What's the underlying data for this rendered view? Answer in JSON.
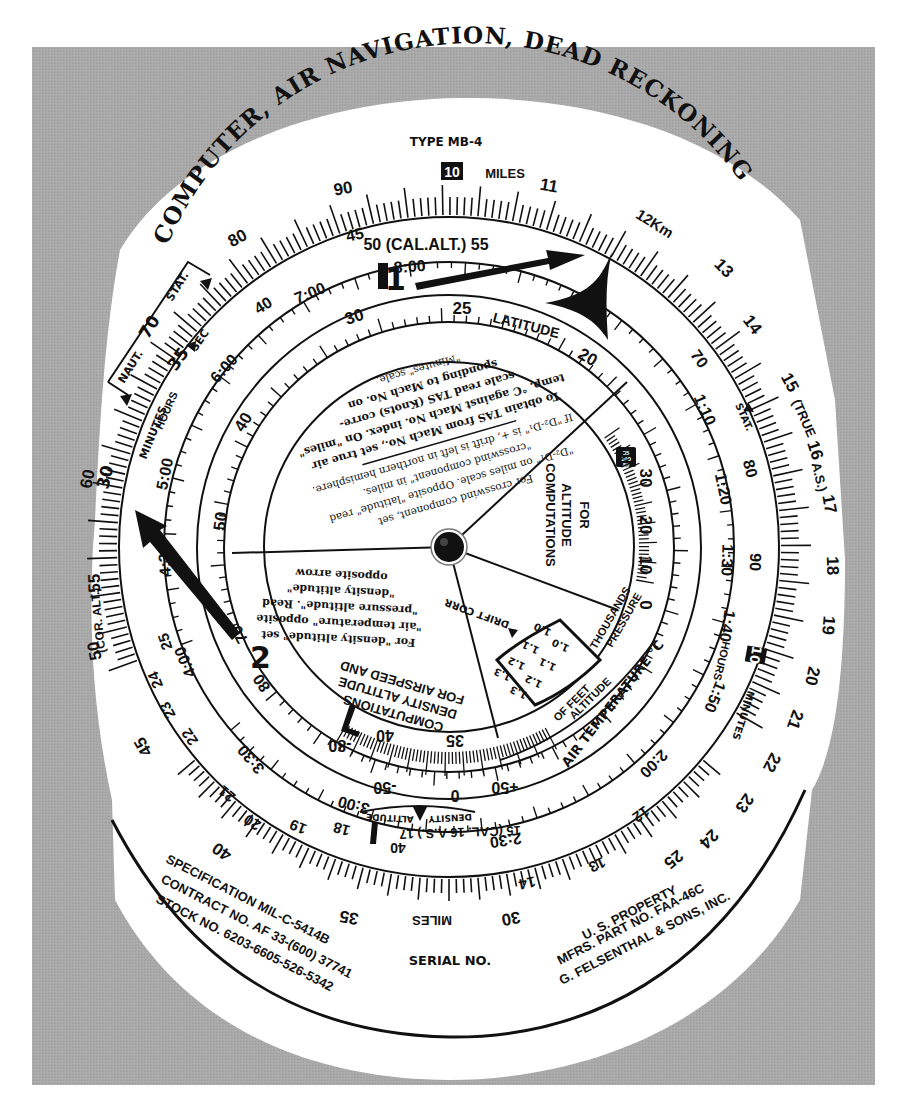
{
  "colors": {
    "mat_gray": "#a7a7a7",
    "card_white": "#ffffff",
    "ink": "#111111"
  },
  "header": {
    "title": "COMPUTER, AIR NAVIGATION, DEAD RECKONING",
    "subtitle": "TYPE MB-4"
  },
  "outer_scale": {
    "miles_label": "MILES",
    "boxed_index": "10",
    "labels": [
      "80",
      "90",
      "11",
      "12Km",
      "13",
      "14",
      "15 (TRUE 16 A.S.) 17",
      "18",
      "19",
      "20",
      "21",
      "22",
      "23",
      "24",
      "25",
      "30",
      "35",
      "40",
      "45",
      "50 (COR. ALT.) 55",
      "60",
      "70"
    ],
    "bottom_miles_label": "MILES",
    "true_as": "(TRUE",
    "true_as2": "A.S.)",
    "cor_alt": "(COR. ALT.)",
    "naut": "NAUT.",
    "stat": "STAT.",
    "stat_right": "STAT.",
    "sec": "SEC",
    "val_35": "35",
    "minutes_left": "MINUTES",
    "minutes_right": "MINUTES",
    "boxed_minutes": "10"
  },
  "inner_scale": {
    "cal_alt": "50 (CAL.ALT.) 55",
    "cal_alt_bottom": "15 (CAL. 16 A.S.) 17",
    "hours_left": "HOURS",
    "hours_right": "HOURS",
    "times": [
      "8:00",
      "7:00",
      "6:00",
      "5:00",
      "4:30",
      "4:00",
      "3:30",
      "3:00",
      "2:30",
      "2:00",
      "1:50",
      "1:40",
      "1:30",
      "1:20",
      "1:10"
    ],
    "numbers": [
      "45",
      "40",
      "30",
      "25",
      "20",
      "19",
      "18",
      "14",
      "13",
      "12",
      "70",
      "80",
      "90",
      "60",
      "50",
      "40",
      "35",
      "30"
    ]
  },
  "latitude_ring": {
    "label": "LATITUDE",
    "values": [
      "30",
      "25",
      "20",
      "40",
      "50",
      "70",
      "80"
    ]
  },
  "instructions_top": [
    "For crosswind component, set",
    "\"D₂-D₁\" on miles scale. Opposite \"latitude\" read",
    "\"crosswind component\" in miles.",
    "If \"D₂-D₁\" is +, drift is left in northern hemisphere.",
    "To obtain TAS from Mach No., set true air",
    "temp. °C against Mach No. index. On \"miles\"",
    "scale read TAS (Knots) corre-",
    "sponding to Mach No. on",
    "\"Minutes\" scale."
  ],
  "instructions_density": [
    "For \"density altitude\" set",
    "\"air temperature\" opposite",
    "\"pressure altitude\". Read",
    "\"density altitude\"",
    "opposite arrow"
  ],
  "sector_altitude": {
    "line1": "FOR",
    "line2": "ALTITUDE",
    "line3": "COMPUTATIONS",
    "scale": [
      "30",
      "20",
      "10",
      "0"
    ],
    "boxed": [
      "35",
      "100",
      "80"
    ]
  },
  "sector_airspeed": {
    "line1": "FOR AIRSPEED AND",
    "line2": "DENSITY ALTITUDE",
    "line3": "COMPUTATIONS"
  },
  "drift_corr": {
    "label": "DRIFT CORR",
    "values": [
      "1.0",
      "1.1",
      "1.2",
      "1.3",
      "1.0",
      "1.1",
      "1.2",
      "1.3"
    ]
  },
  "pressure_alt": {
    "line1": "PRESSURE",
    "line2": "ALTITUDE",
    "line3": "THOUSANDS",
    "line4": "OF FEET"
  },
  "air_temp": {
    "label": "AIR TEMPERATURE °C",
    "values": [
      "-80",
      "-50",
      "0",
      "+50"
    ],
    "density_altitude_values": [
      "40",
      "35"
    ]
  },
  "density_altitude": {
    "left": "ALTITUDE",
    "right": "DENSITY",
    "values": [
      "40"
    ]
  },
  "arrows": {
    "arrow_1_label": "1",
    "arrow_2_label": "2"
  },
  "footer": {
    "spec": "SPECIFICATION MIL-C-5414B",
    "contract": "CONTRACT NO. AF 33-(600) 37741",
    "stock": "STOCK NO. 6203-6605-526-5342",
    "serial": "SERIAL NO.",
    "property": "U. S. PROPERTY",
    "part": "MFRS. PART NO. FAA-46C",
    "maker": "G. FELSENTHAL & SONS, INC."
  }
}
